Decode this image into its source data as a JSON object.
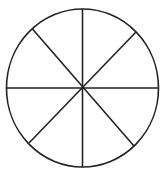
{
  "diagram": {
    "title": "",
    "description": "Circle divided into 8 equal sectors by 4 lines through the center",
    "stroke_color": "#222222",
    "background_color": "#ffffff",
    "stroke_width": 1.6,
    "circle": {
      "cx": 82.5,
      "cy": 88,
      "rx": 76,
      "ry": 79
    },
    "sectors": 8,
    "lines": [
      {
        "name": "vertical-diameter",
        "x1": 82.5,
        "y1": 9,
        "x2": 82.5,
        "y2": 167
      },
      {
        "name": "horizontal-diameter",
        "x1": 6.5,
        "y1": 88,
        "x2": 158.5,
        "y2": 88
      },
      {
        "name": "diagonal-nw-se",
        "x1": 32.5,
        "y1": 29,
        "x2": 134,
        "y2": 146
      },
      {
        "name": "diagonal-ne-sw",
        "x1": 136,
        "y1": 32,
        "x2": 29,
        "y2": 143
      }
    ]
  }
}
